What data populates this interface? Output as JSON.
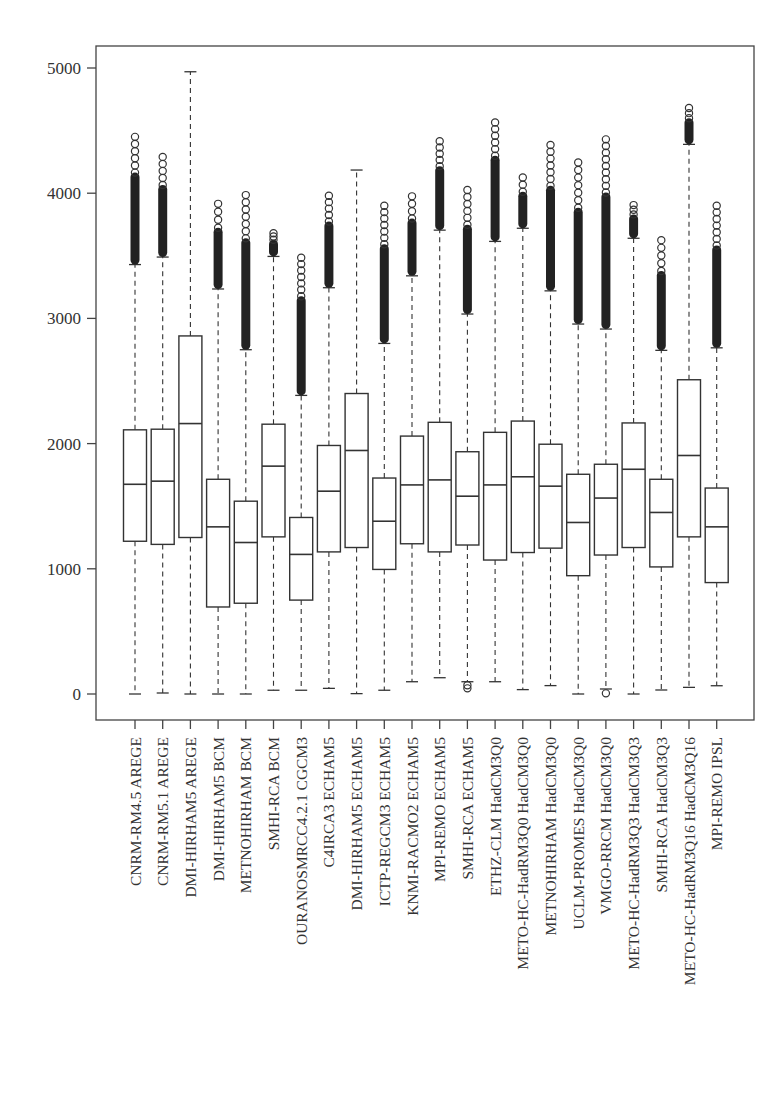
{
  "chart_data": {
    "type": "boxplot",
    "title": "",
    "xlabel": "",
    "ylabel": "",
    "ylim": [
      0,
      5000
    ],
    "yticks": [
      0,
      1000,
      2000,
      3000,
      4000,
      5000
    ],
    "ytick_labels": [
      "0",
      "1000",
      "2000",
      "3000",
      "4000",
      "5000"
    ],
    "grid": false,
    "legend": null,
    "categories": [
      "CNRM-RM4.5 AREGE",
      "CNRM-RM5.1 AREGE",
      "DMI-HIRHAM5 AREGE",
      "DMI-HIRHAM5 BCM",
      "METNOHIRHAM BCM",
      "SMHI-RCA BCM",
      "OURANOSMRCC4.2.1 CGCM3",
      "C4IRCA3 ECHAM5",
      "DMI-HIRHAM5 ECHAM5",
      "ICTP-REGCM3 ECHAM5",
      "KNMI-RACMO2 ECHAM5",
      "MPI-REMO ECHAM5",
      "SMHI-RCA ECHAM5",
      "ETHZ-CLM HadCM3Q0",
      "METO-HC-HadRM3Q0 HadCM3Q0",
      "METNOHIRHAM HadCM3Q0",
      "UCLM-PROMES HadCM3Q0",
      "VMGO-RRCM HadCM3Q0",
      "METO-HC-HadRM3Q3 HadCM3Q3",
      "SMHI-RCA HadCM3Q3",
      "METO-HC-HadRM3Q16 HadCM3Q16",
      "MPI-REMO IPSL"
    ],
    "boxes": [
      {
        "min": 0,
        "q1": 1220,
        "median": 1675,
        "q3": 2110,
        "whisker_high": 3430,
        "outliers_max": 4450,
        "outliers_low": []
      },
      {
        "min": 8,
        "q1": 1195,
        "median": 1700,
        "q3": 2115,
        "whisker_high": 3490,
        "outliers_max": 4290,
        "outliers_low": []
      },
      {
        "min": 0,
        "q1": 1250,
        "median": 2160,
        "q3": 2860,
        "whisker_high": 4970,
        "outliers_max": null,
        "outliers_low": []
      },
      {
        "min": 0,
        "q1": 695,
        "median": 1335,
        "q3": 1715,
        "whisker_high": 3235,
        "outliers_max": 3915,
        "outliers_low": []
      },
      {
        "min": 0,
        "q1": 725,
        "median": 1210,
        "q3": 1540,
        "whisker_high": 2750,
        "outliers_max": 3985,
        "outliers_low": []
      },
      {
        "min": 30,
        "q1": 1255,
        "median": 1820,
        "q3": 2155,
        "whisker_high": 3495,
        "outliers_max": 3680,
        "outliers_low": []
      },
      {
        "min": 30,
        "q1": 750,
        "median": 1115,
        "q3": 1410,
        "whisker_high": 2385,
        "outliers_max": 3485,
        "outliers_low": []
      },
      {
        "min": 45,
        "q1": 1135,
        "median": 1620,
        "q3": 1985,
        "whisker_high": 3245,
        "outliers_max": 3980,
        "outliers_low": []
      },
      {
        "min": 3,
        "q1": 1170,
        "median": 1945,
        "q3": 2400,
        "whisker_high": 4185,
        "outliers_max": null,
        "outliers_low": []
      },
      {
        "min": 30,
        "q1": 995,
        "median": 1380,
        "q3": 1725,
        "whisker_high": 2800,
        "outliers_max": 3900,
        "outliers_low": []
      },
      {
        "min": 98,
        "q1": 1200,
        "median": 1670,
        "q3": 2060,
        "whisker_high": 3340,
        "outliers_max": 3975,
        "outliers_low": []
      },
      {
        "min": 130,
        "q1": 1135,
        "median": 1710,
        "q3": 2170,
        "whisker_high": 3705,
        "outliers_max": 4415,
        "outliers_low": []
      },
      {
        "min": 98,
        "q1": 1190,
        "median": 1580,
        "q3": 1935,
        "whisker_high": 3035,
        "outliers_max": 4025,
        "outliers_low": [
          70,
          45
        ]
      },
      {
        "min": 98,
        "q1": 1070,
        "median": 1670,
        "q3": 2090,
        "whisker_high": 3615,
        "outliers_max": 4565,
        "outliers_low": []
      },
      {
        "min": 35,
        "q1": 1130,
        "median": 1735,
        "q3": 2180,
        "whisker_high": 3720,
        "outliers_max": 4125,
        "outliers_low": []
      },
      {
        "min": 67,
        "q1": 1165,
        "median": 1660,
        "q3": 1995,
        "whisker_high": 3220,
        "outliers_max": 4385,
        "outliers_low": []
      },
      {
        "min": 0,
        "q1": 945,
        "median": 1370,
        "q3": 1755,
        "whisker_high": 2955,
        "outliers_max": 4245,
        "outliers_low": []
      },
      {
        "min": 40,
        "q1": 1110,
        "median": 1565,
        "q3": 1835,
        "whisker_high": 2915,
        "outliers_max": 4430,
        "outliers_low": [
          5
        ]
      },
      {
        "min": 0,
        "q1": 1170,
        "median": 1795,
        "q3": 2165,
        "whisker_high": 3640,
        "outliers_max": 3905,
        "outliers_low": []
      },
      {
        "min": 32,
        "q1": 1015,
        "median": 1450,
        "q3": 1715,
        "whisker_high": 2745,
        "outliers_max": 3625,
        "outliers_low": []
      },
      {
        "min": 53,
        "q1": 1255,
        "median": 1905,
        "q3": 2510,
        "whisker_high": 4390,
        "outliers_max": 4680,
        "outliers_low": []
      },
      {
        "min": 66,
        "q1": 890,
        "median": 1335,
        "q3": 1645,
        "whisker_high": 2765,
        "outliers_max": 3900,
        "outliers_low": []
      }
    ]
  },
  "layout_px": {
    "frame": {
      "left": 96,
      "top": 46,
      "right": 754,
      "bottom": 720
    },
    "y_zero_px": 694,
    "px_per_unit": 0.1252,
    "first_box_x": 135,
    "box_spacing": 27.7,
    "box_width": 23
  }
}
